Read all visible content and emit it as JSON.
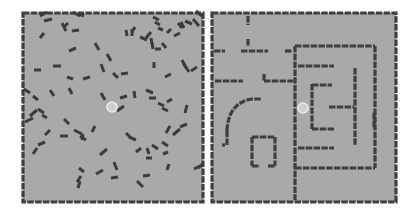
{
  "scene": "two top-down navigation environments",
  "colors": {
    "floor": "#a9a9a9",
    "wall": "#3f3f3f",
    "agent": "#cfcfcf",
    "background": "#ffffff"
  },
  "panels": [
    {
      "name": "random-obstacles-env",
      "bounds": [
        23,
        13,
        203,
        202
      ],
      "agent": {
        "x": 112,
        "y": 107,
        "r": 5
      },
      "rods": [
        [
          40,
          16,
          47,
          12
        ],
        [
          44,
          21,
          52,
          19
        ],
        [
          73,
          12,
          80,
          16
        ],
        [
          79,
          14,
          84,
          16
        ],
        [
          62,
          23,
          66,
          31
        ],
        [
          64,
          27,
          68,
          23
        ],
        [
          72,
          31,
          79,
          30
        ],
        [
          40,
          38,
          44,
          33
        ],
        [
          69,
          51,
          76,
          48
        ],
        [
          95,
          43,
          99,
          50
        ],
        [
          107,
          54,
          111,
          61
        ],
        [
          101,
          64,
          104,
          72
        ],
        [
          113,
          73,
          118,
          78
        ],
        [
          121,
          74,
          128,
          73
        ],
        [
          132,
          32,
          135,
          27
        ],
        [
          146,
          38,
          151,
          32
        ],
        [
          162,
          43,
          166,
          48
        ],
        [
          126,
          30,
          127,
          36
        ],
        [
          132,
          29,
          132,
          36
        ],
        [
          140,
          37,
          147,
          40
        ],
        [
          152,
          43,
          153,
          49
        ],
        [
          155,
          49,
          161,
          49
        ],
        [
          151,
          38,
          152,
          44
        ],
        [
          167,
          33,
          171,
          29
        ],
        [
          174,
          36,
          180,
          33
        ],
        [
          178,
          23,
          182,
          28
        ],
        [
          185,
          21,
          192,
          24
        ],
        [
          193,
          19,
          199,
          26
        ],
        [
          196,
          11,
          202,
          16
        ],
        [
          191,
          71,
          197,
          67
        ],
        [
          184,
          64,
          189,
          72
        ],
        [
          182,
          60,
          186,
          68
        ],
        [
          181,
          22,
          184,
          28
        ],
        [
          155,
          22,
          160,
          25
        ],
        [
          158,
          28,
          163,
          30
        ],
        [
          153,
          17,
          159,
          20
        ],
        [
          154,
          62,
          154,
          68
        ],
        [
          165,
          77,
          171,
          74
        ],
        [
          34,
          70,
          41,
          70
        ],
        [
          53,
          66,
          61,
          66
        ],
        [
          67,
          77,
          73,
          79
        ],
        [
          83,
          79,
          90,
          77
        ],
        [
          24,
          89,
          30,
          93
        ],
        [
          33,
          96,
          38,
          100
        ],
        [
          50,
          90,
          54,
          96
        ],
        [
          69,
          88,
          72,
          94
        ],
        [
          101,
          93,
          105,
          100
        ],
        [
          120,
          98,
          127,
          96
        ],
        [
          117,
          111,
          124,
          106
        ],
        [
          134,
          91,
          135,
          98
        ],
        [
          146,
          90,
          153,
          93
        ],
        [
          149,
          98,
          156,
          98
        ],
        [
          158,
          103,
          164,
          106
        ],
        [
          162,
          108,
          168,
          111
        ],
        [
          167,
          102,
          172,
          99
        ],
        [
          185,
          113,
          187,
          105
        ],
        [
          30,
          116,
          37,
          110
        ],
        [
          38,
          109,
          44,
          113
        ],
        [
          42,
          115,
          47,
          118
        ],
        [
          25,
          122,
          33,
          118
        ],
        [
          64,
          119,
          69,
          124
        ],
        [
          74,
          130,
          82,
          134
        ],
        [
          80,
          136,
          86,
          140
        ],
        [
          82,
          140,
          83,
          134
        ],
        [
          92,
          132,
          95,
          126
        ],
        [
          45,
          135,
          50,
          130
        ],
        [
          60,
          136,
          68,
          136
        ],
        [
          38,
          145,
          45,
          142
        ],
        [
          33,
          154,
          37,
          148
        ],
        [
          100,
          155,
          107,
          149
        ],
        [
          114,
          162,
          117,
          170
        ],
        [
          79,
          168,
          84,
          172
        ],
        [
          96,
          174,
          103,
          170
        ],
        [
          77,
          182,
          81,
          176
        ],
        [
          78,
          188,
          80,
          181
        ],
        [
          111,
          178,
          118,
          177
        ],
        [
          126,
          133,
          130,
          137
        ],
        [
          129,
          137,
          136,
          140
        ],
        [
          136,
          152,
          141,
          148
        ],
        [
          147,
          148,
          149,
          154
        ],
        [
          146,
          158,
          152,
          158
        ],
        [
          152,
          145,
          158,
          149
        ],
        [
          162,
          142,
          168,
          146
        ],
        [
          163,
          154,
          168,
          152
        ],
        [
          166,
          133,
          170,
          126
        ],
        [
          180,
          127,
          187,
          124
        ],
        [
          173,
          135,
          180,
          129
        ],
        [
          167,
          170,
          169,
          164
        ],
        [
          143,
          176,
          150,
          175
        ],
        [
          137,
          181,
          143,
          187
        ],
        [
          198,
          168,
          203,
          164
        ],
        [
          194,
          169,
          200,
          166
        ]
      ]
    },
    {
      "name": "maze-env",
      "bounds": [
        212,
        13,
        396,
        202
      ],
      "agent": {
        "x": 303,
        "y": 108,
        "r": 5
      },
      "walls": [
        [
          248,
          16,
          248,
          25
        ],
        [
          248,
          39,
          248,
          47
        ],
        [
          214,
          51,
          225,
          51
        ],
        [
          241,
          51,
          268,
          51
        ],
        [
          285,
          51,
          292,
          51
        ],
        [
          215,
          81,
          243,
          81
        ],
        [
          264,
          74,
          264,
          81
        ],
        [
          264,
          81,
          293,
          81
        ],
        [
          295,
          46,
          375,
          46
        ],
        [
          295,
          46,
          295,
          200
        ],
        [
          375,
          46,
          375,
          168
        ],
        [
          295,
          168,
          375,
          168
        ],
        [
          298,
          66,
          334,
          66
        ],
        [
          355,
          68,
          355,
          146
        ],
        [
          312,
          84,
          312,
          129
        ],
        [
          312,
          85,
          332,
          85
        ],
        [
          312,
          129,
          334,
          129
        ],
        [
          329,
          107,
          354,
          107
        ],
        [
          298,
          148,
          334,
          148
        ],
        [
          374,
          113,
          374,
          128
        ],
        [
          222,
          145,
          225,
          145
        ],
        [
          227,
          145,
          227,
          131
        ],
        [
          252,
          137,
          252,
          166
        ],
        [
          252,
          137,
          275,
          137
        ],
        [
          275,
          137,
          275,
          166
        ],
        [
          252,
          166,
          260,
          166
        ],
        [
          268,
          166,
          275,
          166
        ]
      ],
      "arcs": [
        {
          "d": "M227 131 Q228 103 252 99 L262 99"
        }
      ]
    }
  ]
}
